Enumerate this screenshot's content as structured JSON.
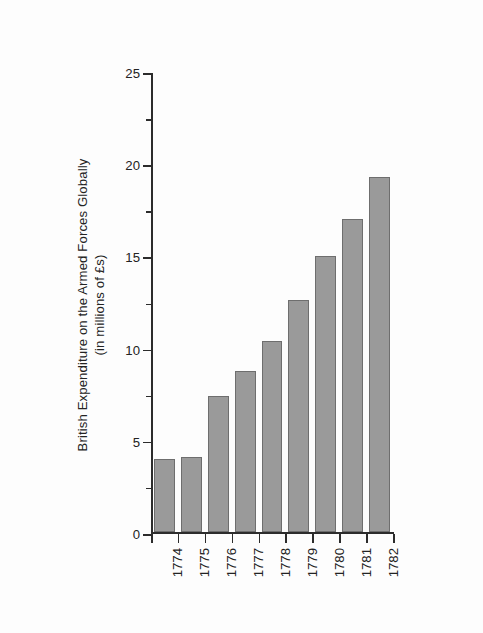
{
  "chart_data": {
    "type": "bar",
    "title": "",
    "subtitle": "",
    "xlabel": "",
    "ylabel_line1": "British Expenditure on the Armed Forces Globally",
    "ylabel_line2": "(in millions of £s)",
    "categories": [
      "1774",
      "1775",
      "1776",
      "1777",
      "1778",
      "1779",
      "1780",
      "1781",
      "1782"
    ],
    "values": [
      4.0,
      4.1,
      7.4,
      8.75,
      10.4,
      12.6,
      15.0,
      17.0,
      19.25
    ],
    "series": [
      {
        "name": "British Expenditure on the Armed Forces Globally",
        "values": [
          4.0,
          4.1,
          7.4,
          8.75,
          10.4,
          12.6,
          15.0,
          17.0,
          19.25
        ]
      }
    ],
    "ylim": [
      0,
      25
    ],
    "y_major_ticks": [
      0,
      5,
      10,
      15,
      20,
      25
    ],
    "y_minor_ticks": [
      2.5,
      7.5,
      12.5,
      17.5,
      22.5
    ],
    "y_tick_labels": [
      "0",
      "5",
      "10",
      "15",
      "20",
      "25"
    ],
    "grid": false,
    "legend": false,
    "legend_position": "none",
    "bar_color": "#9a9a9a",
    "bar_edge_color": "#6e6e6e",
    "axis_color": "#2c2c2c",
    "text_color": "#232323",
    "background_color": "#ffffff",
    "x_tick_label_rotation": 90
  }
}
